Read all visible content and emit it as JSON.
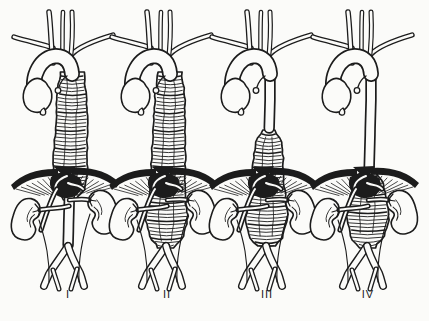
{
  "figure": {
    "depicts": "Four-panel line illustration of thoracoabdominal aortic aneurysm extents (types I-IV)",
    "background_color": "#fbfbf9",
    "ink_color": "#1c1c1c"
  },
  "panels": [
    {
      "label": "I",
      "aneurysm_from": "proximal-descending-aorta",
      "aneurysm_to": "above-renal-arteries"
    },
    {
      "label": "II",
      "aneurysm_from": "proximal-descending-aorta",
      "aneurysm_to": "aortic-bifurcation"
    },
    {
      "label": "III",
      "aneurysm_from": "mid-descending-aorta",
      "aneurysm_to": "aortic-bifurcation"
    },
    {
      "label": "IV",
      "aneurysm_from": "infradiaphragmatic-aorta",
      "aneurysm_to": "aortic-bifurcation"
    }
  ]
}
